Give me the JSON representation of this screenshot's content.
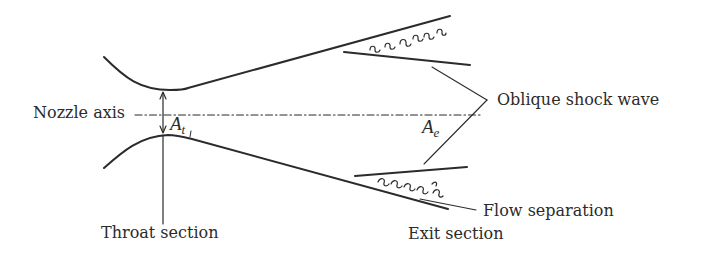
{
  "diagram": {
    "labels": {
      "nozzle_axis": "Nozzle axis",
      "throat_section": "Throat section",
      "exit_section": "Exit section",
      "oblique_shock_wave": "Oblique shock wave",
      "flow_separation": "Flow separation"
    },
    "symbols": {
      "throat_area_base": "A",
      "throat_area_sub": "t",
      "exit_area_base": "A",
      "exit_area_sub": "e"
    },
    "colors": {
      "line": "#2b2b2b",
      "background": "#ffffff"
    }
  }
}
